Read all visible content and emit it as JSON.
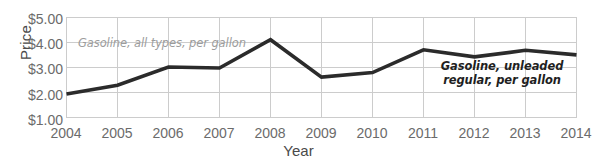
{
  "chart_data": {
    "type": "line",
    "title": "",
    "xlabel": "Year",
    "ylabel": "Price",
    "x": [
      2004,
      2005,
      2006,
      2007,
      2008,
      2009,
      2010,
      2011,
      2012,
      2013,
      2014
    ],
    "xticklabels": [
      "2004",
      "2005",
      "2006",
      "2007",
      "2008",
      "2009",
      "2010",
      "2011",
      "2012",
      "2013",
      "2014"
    ],
    "yticklabels": [
      "$5.00",
      "$4.00",
      "$3.00",
      "$2.00",
      "$1.00"
    ],
    "ytickvalues": [
      5.0,
      4.0,
      3.0,
      2.0,
      1.0
    ],
    "ylim": [
      1.0,
      5.0
    ],
    "xlim": [
      2004,
      2014
    ],
    "grid": "both",
    "legend": "none",
    "series": [
      {
        "name": "Gasoline, unleaded regular, per gallon",
        "values": [
          1.95,
          2.3,
          3.02,
          2.98,
          4.1,
          2.62,
          2.8,
          3.7,
          3.42,
          3.68,
          3.5
        ],
        "color": "#2b2b2b",
        "linewidth": 3.6
      }
    ],
    "annotations": [
      {
        "id": "annotation-all-types",
        "text": "Gasoline, all types, per gallon",
        "lines": [
          "Gasoline, all types, per gallon"
        ],
        "style": "light-italic",
        "color": "#9c9c9c"
      },
      {
        "id": "annotation-unleaded-regular",
        "text": "Gasoline, unleaded regular, per gallon",
        "lines": [
          "Gasoline, unleaded",
          "regular, per gallon"
        ],
        "style": "bold-italic",
        "color": "#1f1f1f"
      }
    ],
    "colors": {
      "line": "#2b2b2b",
      "grid": "#cccccc",
      "axis_text": "#6b6b6b",
      "title_text": "#4a4a4a",
      "background": "#ffffff"
    }
  }
}
